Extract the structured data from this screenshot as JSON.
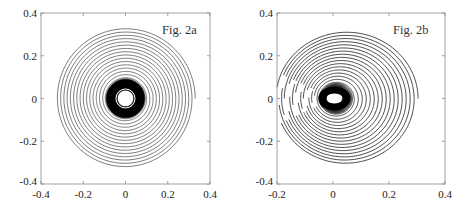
{
  "chart_data": [
    {
      "type": "line",
      "title": "Fig. 2a",
      "xlabel": "",
      "ylabel": "",
      "xlim": [
        -0.4,
        0.4
      ],
      "ylim": [
        -0.4,
        0.4
      ],
      "xticks": [
        "-0.4",
        "-0.2",
        "0",
        "0.2",
        "0.4"
      ],
      "xtick_values": [
        -0.4,
        -0.2,
        0,
        0.2,
        0.4
      ],
      "yticks": [
        "0.4",
        "0.2",
        "0",
        "-0.2",
        "-0.4"
      ],
      "ytick_values": [
        0.4,
        0.2,
        0,
        -0.2,
        -0.4
      ],
      "grid": false,
      "legend": null,
      "description": "Phase-space trajectory spiraling inward to a near-circular limit cycle centered at origin; dense dark annulus between r≈0.04 and r≈0.09, white core r≈0.02, outer spiral reaches r≈0.33",
      "spiral": {
        "center": [
          0,
          0
        ],
        "r_outer": 0.33,
        "r_inner": 0.018,
        "ellipse_x": 1.0,
        "ellipse_y": 1.0,
        "turns": 60,
        "dense_band": [
          0.035,
          0.1
        ],
        "open_gap_angle_deg": 200
      }
    },
    {
      "type": "line",
      "title": "Fig. 2b",
      "xlabel": "",
      "ylabel": "",
      "xlim": [
        -0.2,
        0.4
      ],
      "ylim": [
        -0.4,
        0.4
      ],
      "xticks": [
        "-0.2",
        "0",
        "0.2",
        "0.4"
      ],
      "xtick_values": [
        -0.2,
        0,
        0.2,
        0.4
      ],
      "yticks": [
        "0.4",
        "0.2",
        "0",
        "-0.2",
        "-0.4"
      ],
      "ytick_values": [
        0.4,
        0.2,
        0,
        -0.2,
        -0.4
      ],
      "grid": false,
      "legend": null,
      "description": "Phase-space trajectory spiraling inward along eccentric elliptical loops converging to the origin; outer loops span x≈-0.16..0.32 and y≈-0.33..0.31, dense dark core near origin with white center",
      "spiral": {
        "center": [
          0,
          0
        ],
        "r_outer": 0.32,
        "r_inner": 0.02,
        "ellipse_x": 1.0,
        "ellipse_y": 1.0,
        "turns": 40,
        "shift_left": 0.5,
        "dense_band": [
          0.03,
          0.08
        ],
        "broken_left": true
      }
    }
  ],
  "panels": {
    "left": {
      "title": "Fig. 2a"
    },
    "right": {
      "title": "Fig. 2b"
    }
  }
}
